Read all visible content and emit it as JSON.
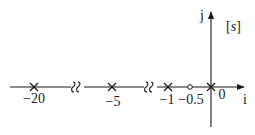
{
  "diagram": {
    "type": "pole-zero-plot",
    "plane_label_open": "[",
    "plane_label_var": "s",
    "plane_label_close": "]",
    "real_axis_label": "i",
    "imag_axis_label": "j",
    "colors": {
      "stroke": "#1a1a1a",
      "background": "#ffffff"
    },
    "poles": [
      {
        "value": -20,
        "label": "−20"
      },
      {
        "value": -5,
        "label": "−5"
      },
      {
        "value": -1,
        "label": "−1"
      },
      {
        "value": 0,
        "label": "0"
      }
    ],
    "zeros": [
      {
        "value": -0.5,
        "label": "−0.5"
      }
    ],
    "axis_breaks": [
      {
        "between": [
          -20,
          -5
        ]
      },
      {
        "between": [
          -5,
          -1
        ]
      }
    ]
  }
}
